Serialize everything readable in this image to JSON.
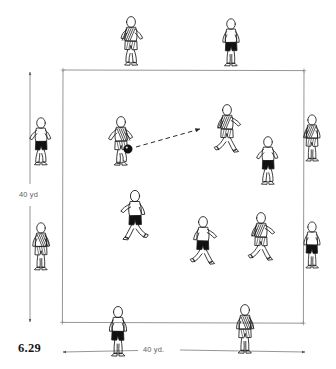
{
  "figure": {
    "number": "6.29",
    "caption_number_name": "figure-number",
    "type": "soccer-drill-diagram"
  },
  "dimensions": {
    "vertical_label": "40 yd",
    "horizontal_label": "40 yd.",
    "grid_width_yards": 40,
    "grid_height_yards": 40
  },
  "field": {
    "shape": "square",
    "x": 63,
    "y": 70,
    "width": 240,
    "height": 252,
    "line_color": "#8a8a8a",
    "corner_marker": "tick"
  },
  "ball": {
    "x": 128,
    "y": 149,
    "radius": 4.2,
    "color": "#111111",
    "label": "ball"
  },
  "pass_arrow": {
    "from_x": 136,
    "from_y": 147,
    "to_x": 200,
    "to_y": 129,
    "style": "dashed",
    "color": "#2a2a2a",
    "label": "pass-direction"
  },
  "colors": {
    "ink": "#1a1a1a",
    "field_line": "#8a8a8a",
    "dim_line": "#7b7b7b",
    "dark_kit": "#111111",
    "light_kit": "#ffffff",
    "stripe": "#2b2b2b"
  },
  "legend_note": "Players outside the grid lines are supporting target players; players inside contest possession.",
  "players": [
    {
      "id": "p1",
      "name": "perimeter-player-top-left",
      "x": 131,
      "y": 22,
      "scale": 1.0,
      "kit": "striped",
      "facing": "left",
      "pose": "jog",
      "zone": "perimeter-top"
    },
    {
      "id": "p2",
      "name": "perimeter-player-top-right",
      "x": 231,
      "y": 24,
      "scale": 0.97,
      "kit": "dark",
      "facing": "front",
      "pose": "stand",
      "zone": "perimeter-top"
    },
    {
      "id": "p3",
      "name": "perimeter-player-left-upper",
      "x": 41,
      "y": 123,
      "scale": 0.97,
      "kit": "dark",
      "facing": "right",
      "pose": "jog",
      "zone": "perimeter-left"
    },
    {
      "id": "p4",
      "name": "perimeter-player-left-lower",
      "x": 41,
      "y": 228,
      "scale": 0.97,
      "kit": "striped",
      "facing": "front",
      "pose": "stand",
      "zone": "perimeter-left"
    },
    {
      "id": "p5",
      "name": "perimeter-player-right-upper",
      "x": 312,
      "y": 120,
      "scale": 0.95,
      "kit": "striped",
      "facing": "left",
      "pose": "stand",
      "zone": "perimeter-right"
    },
    {
      "id": "p6",
      "name": "perimeter-player-right-lower",
      "x": 312,
      "y": 227,
      "scale": 0.95,
      "kit": "dark",
      "facing": "left",
      "pose": "stand",
      "zone": "perimeter-right"
    },
    {
      "id": "p7",
      "name": "perimeter-player-bottom-left",
      "x": 118,
      "y": 312,
      "scale": 1.02,
      "kit": "dark",
      "facing": "left",
      "pose": "stand",
      "zone": "perimeter-bottom"
    },
    {
      "id": "p8",
      "name": "perimeter-player-bottom-right",
      "x": 245,
      "y": 310,
      "scale": 1.0,
      "kit": "striped",
      "facing": "front",
      "pose": "stand",
      "zone": "perimeter-bottom"
    },
    {
      "id": "p9",
      "name": "inside-player-passer",
      "x": 121,
      "y": 122,
      "scale": 1.0,
      "kit": "striped",
      "facing": "right",
      "pose": "kick",
      "zone": "inside"
    },
    {
      "id": "p10",
      "name": "inside-player-receiver",
      "x": 227,
      "y": 110,
      "scale": 1.0,
      "kit": "striped",
      "facing": "left",
      "pose": "run",
      "zone": "inside"
    },
    {
      "id": "p11",
      "name": "inside-player-right-support",
      "x": 268,
      "y": 142,
      "scale": 0.98,
      "kit": "dark",
      "facing": "front",
      "pose": "jog",
      "zone": "inside"
    },
    {
      "id": "p12",
      "name": "inside-player-center",
      "x": 135,
      "y": 196,
      "scale": 1.04,
      "kit": "dark",
      "facing": "front",
      "pose": "run",
      "zone": "inside"
    },
    {
      "id": "p13",
      "name": "inside-player-center-right",
      "x": 203,
      "y": 222,
      "scale": 1.0,
      "kit": "dark",
      "facing": "left",
      "pose": "run",
      "zone": "inside"
    },
    {
      "id": "p14",
      "name": "inside-player-right-runner",
      "x": 261,
      "y": 218,
      "scale": 1.0,
      "kit": "striped",
      "facing": "left",
      "pose": "run",
      "zone": "inside"
    }
  ]
}
